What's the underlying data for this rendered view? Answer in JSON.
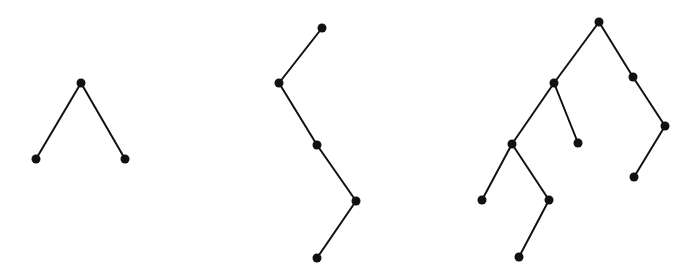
{
  "diagram": {
    "type": "binary-trees",
    "colors": {
      "edge": "#111111",
      "node": "#111111",
      "background": "#ffffff"
    },
    "node_radius": 4.5,
    "trees": [
      {
        "name": "tree-1",
        "nodes": [
          {
            "id": "r",
            "x": 81,
            "y": 83
          },
          {
            "id": "l",
            "x": 36,
            "y": 159
          },
          {
            "id": "rr",
            "x": 125,
            "y": 159
          }
        ],
        "edges": [
          [
            "r",
            "l"
          ],
          [
            "r",
            "rr"
          ]
        ]
      },
      {
        "name": "tree-2",
        "nodes": [
          {
            "id": "r",
            "x": 322,
            "y": 28
          },
          {
            "id": "a",
            "x": 279,
            "y": 83
          },
          {
            "id": "b",
            "x": 317,
            "y": 145
          },
          {
            "id": "c",
            "x": 356,
            "y": 201
          },
          {
            "id": "d",
            "x": 317,
            "y": 258
          }
        ],
        "edges": [
          [
            "r",
            "a"
          ],
          [
            "a",
            "b"
          ],
          [
            "b",
            "c"
          ],
          [
            "c",
            "d"
          ]
        ]
      },
      {
        "name": "tree-3",
        "nodes": [
          {
            "id": "r",
            "x": 599,
            "y": 22
          },
          {
            "id": "a",
            "x": 554,
            "y": 83
          },
          {
            "id": "b",
            "x": 633,
            "y": 77
          },
          {
            "id": "c",
            "x": 512,
            "y": 144
          },
          {
            "id": "d",
            "x": 578,
            "y": 143
          },
          {
            "id": "e",
            "x": 665,
            "y": 126
          },
          {
            "id": "f",
            "x": 634,
            "y": 177
          },
          {
            "id": "g",
            "x": 482,
            "y": 200
          },
          {
            "id": "h",
            "x": 549,
            "y": 200
          },
          {
            "id": "i",
            "x": 519,
            "y": 257
          }
        ],
        "edges": [
          [
            "r",
            "a"
          ],
          [
            "r",
            "b"
          ],
          [
            "a",
            "c"
          ],
          [
            "a",
            "d"
          ],
          [
            "b",
            "e"
          ],
          [
            "e",
            "f"
          ],
          [
            "c",
            "g"
          ],
          [
            "c",
            "h"
          ],
          [
            "h",
            "i"
          ]
        ]
      }
    ]
  }
}
